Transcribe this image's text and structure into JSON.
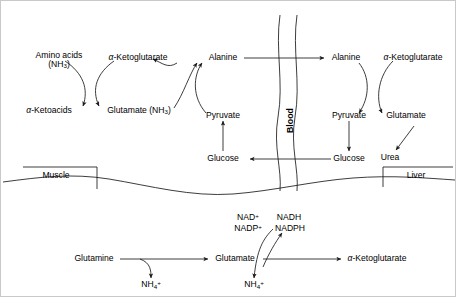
{
  "figure": {
    "compartments": {
      "muscle": "Muscle",
      "liver": "Liver",
      "blood": "Blood"
    }
  },
  "colors": {
    "line": "#1a1a1a",
    "text": "#000000",
    "border": "#c9c9c9",
    "background": "#ffffff"
  },
  "muscle_side": {
    "amino_acids": "Amino acids",
    "amino_acids_group": "(NH3)",
    "keto_acids": "α-Ketoacids",
    "ketoglutarate": "α-Ketoglutarate",
    "glutamate": "Glutamate (NH3)",
    "alanine": "Alanine",
    "pyruvate": "Pyruvate",
    "glucose": "Glucose"
  },
  "liver_side": {
    "alanine": "Alanine",
    "ketoglutarate": "α-Ketoglutarate",
    "pyruvate": "Pyruvate",
    "glutamate": "Glutamate",
    "glucose": "Glucose",
    "urea": "Urea"
  },
  "bottom_pathway": {
    "glutamine": "Glutamine",
    "glutamate": "Glutamate",
    "ketoglutarate": "α-Ketoglutarate",
    "ammonium_1": "NH4+",
    "ammonium_2": "NH4+",
    "cofactors_in_1": "NAD+",
    "cofactors_in_2": "NADP+",
    "cofactors_out_1": "NADH",
    "cofactors_out_2": "NADPH"
  }
}
